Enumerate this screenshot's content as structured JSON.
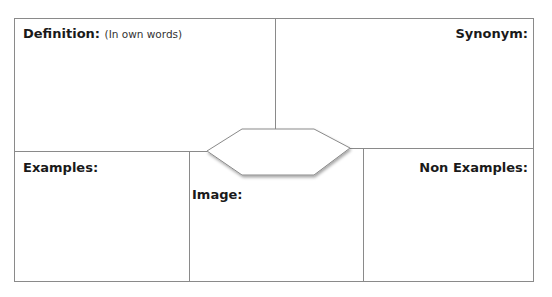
{
  "frayer_model": {
    "quadrants": {
      "definition": {
        "label": "Definition:",
        "note": "(In own words)"
      },
      "synonym": {
        "label": "Synonym:"
      },
      "examples": {
        "label": "Examples:"
      },
      "non_examples": {
        "label": "Non Examples:"
      },
      "image": {
        "label": "Image:"
      }
    },
    "center_term": ""
  },
  "colors": {
    "border": "#8a8a8a",
    "text": "#1a1a1a",
    "background": "#ffffff"
  }
}
